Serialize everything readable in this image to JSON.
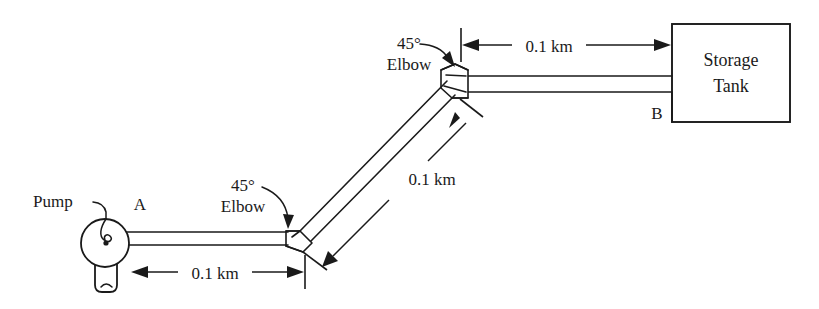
{
  "figure": {
    "background_color": "#ffffff",
    "line_color": "#1a1a1a"
  },
  "equipment": {
    "pump": {
      "label": "Pump",
      "icon": "centrifugal-pump-icon"
    },
    "tank": {
      "label_line1": "Storage",
      "label_line2": "Tank",
      "icon": "storage-tank-icon"
    }
  },
  "points": {
    "a": "A",
    "b": "B"
  },
  "fittings": [
    {
      "angle_label": "45°",
      "type_label": "Elbow",
      "position": "lower-left"
    },
    {
      "angle_label": "45°",
      "type_label": "Elbow",
      "position": "upper-middle"
    }
  ],
  "dimensions": [
    {
      "id": "horizontal-lower",
      "value": "0.1 km",
      "orientation": "horizontal",
      "segment": "pump-to-first-elbow"
    },
    {
      "id": "diagonal",
      "value": "0.1 km",
      "orientation": "diagonal-45",
      "segment": "first-elbow-to-second-elbow"
    },
    {
      "id": "horizontal-upper",
      "value": "0.1 km",
      "orientation": "horizontal",
      "segment": "second-elbow-to-tank"
    }
  ]
}
